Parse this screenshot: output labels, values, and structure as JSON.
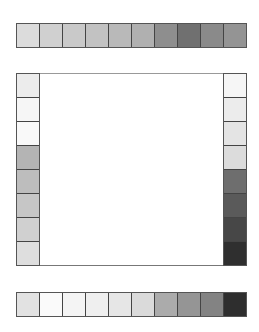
{
  "chart": {
    "top_strip": {
      "cells": [
        "#dcdcdc",
        "#d0d0d0",
        "#c9c9c9",
        "#c2c2c2",
        "#b9b9b9",
        "#b0b0b0",
        "#8e8e8e",
        "#707070",
        "#8a8a8a",
        "#949494"
      ]
    },
    "left_column": {
      "cells": [
        "#ececec",
        "#f6f6f6",
        "#f9f9f9",
        "#b4b4b4",
        "#bdbdbd",
        "#c6c6c6",
        "#d0d0d0",
        "#dedede"
      ]
    },
    "right_column": {
      "cells": [
        "#f6f6f6",
        "#ececec",
        "#e4e4e4",
        "#dcdcdc",
        "#6e6e6e",
        "#5a5a5a",
        "#474747",
        "#2f2f2f"
      ]
    },
    "bottom_strip": {
      "cells": [
        "#e2e2e2",
        "#fafafa",
        "#f4f4f4",
        "#efefef",
        "#e6e6e6",
        "#dadada",
        "#ababab",
        "#959595",
        "#838383",
        "#2e2e2e"
      ]
    },
    "frame": {
      "background": "#ffffff"
    }
  }
}
